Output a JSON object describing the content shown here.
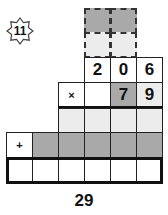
{
  "puzzle": {
    "badge_number": "11",
    "multiplicand": [
      "2",
      "0",
      "6"
    ],
    "multiplier_operator": "×",
    "multiplier": [
      "7",
      "9"
    ],
    "sum_operator": "+",
    "result_label": "29"
  },
  "colors": {
    "dark_cell": "#a9a9a9",
    "light_cell": "#ececec",
    "border": "#111111"
  }
}
